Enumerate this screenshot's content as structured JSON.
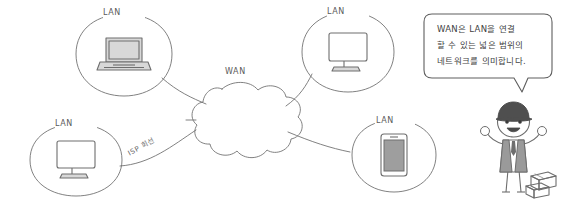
{
  "diagram": {
    "title_visible": false,
    "background_color": "#ffffff",
    "line_color": "#707070",
    "device_fill": "#d9d9d9",
    "text_color": "#4a4a4a"
  },
  "cloud": {
    "label": "WAN",
    "label_x": 228,
    "label_y": 68
  },
  "lan_nodes": [
    {
      "id": "lan-laptop",
      "label": "LAN",
      "label_x": 112,
      "label_y": 11,
      "device": "laptop-icon",
      "cx": 124,
      "cy": 55,
      "rx": 48,
      "ry": 42
    },
    {
      "id": "lan-monitor-top",
      "label": "LAN",
      "label_x": 336,
      "label_y": 11,
      "device": "monitor-icon",
      "cx": 348,
      "cy": 52,
      "rx": 46,
      "ry": 41
    },
    {
      "id": "lan-monitor-left",
      "label": "LAN",
      "label_x": 62,
      "label_y": 124,
      "device": "monitor-icon",
      "cx": 76,
      "cy": 158,
      "rx": 46,
      "ry": 38
    },
    {
      "id": "lan-phone",
      "label": "LAN",
      "label_x": 383,
      "label_y": 121,
      "device": "smartphone-icon",
      "cx": 394,
      "cy": 155,
      "rx": 44,
      "ry": 39
    }
  ],
  "isp_link": {
    "label": "ISP 회선",
    "x": 128,
    "y": 148,
    "rotation": -28
  },
  "speech_bubble": {
    "lines": [
      "WAN은 LAN을 연결",
      "할 수 있는 넓은 범위의",
      "네트워크를 의미합니다."
    ],
    "x": 426,
    "y": 14,
    "width": 124,
    "height": 64
  },
  "character": {
    "name": "delivery-worker-character",
    "cap_color": "#4f4f4f",
    "vest_color": "#9a9a9a",
    "skin_color": "#ffffff",
    "boxes_label": "parcel-boxes"
  }
}
